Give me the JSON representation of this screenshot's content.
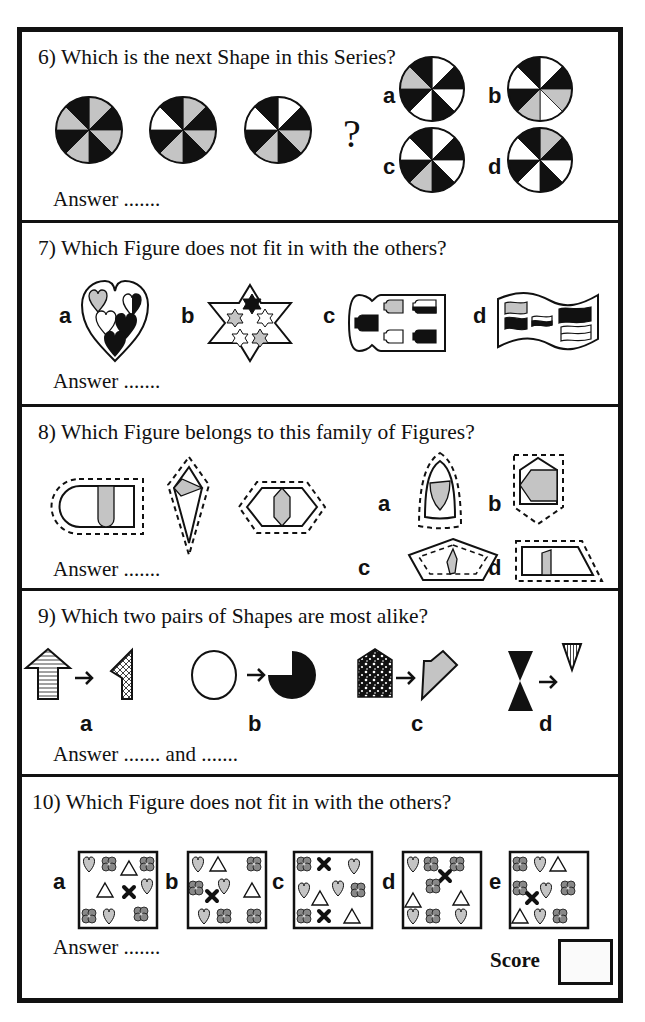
{
  "colors": {
    "ink": "#111111",
    "gray_fill": "#c4c4c4",
    "paper": "#ffffff"
  },
  "questions": [
    {
      "number": "6",
      "prompt": "6) Which is the next Shape in this Series?",
      "answer_line": "Answer .......",
      "question_mark": "?",
      "series": [
        [
          "gray",
          "black",
          "gray",
          "black",
          "gray",
          "black",
          "gray",
          "black"
        ],
        [
          "gray",
          "black",
          "gray",
          "black",
          "gray",
          "black",
          "white",
          "black"
        ],
        [
          "white",
          "black",
          "gray",
          "black",
          "gray",
          "black",
          "white",
          "black"
        ]
      ],
      "options": [
        {
          "label": "a",
          "segments": [
            "white",
            "black",
            "white",
            "black",
            "white",
            "black",
            "gray",
            "black"
          ]
        },
        {
          "label": "b",
          "segments": [
            "white",
            "black",
            "gray",
            "white",
            "gray",
            "black",
            "white",
            "black"
          ]
        },
        {
          "label": "c",
          "segments": [
            "white",
            "black",
            "white",
            "black",
            "gray",
            "black",
            "white",
            "black"
          ]
        },
        {
          "label": "d",
          "segments": [
            "gray",
            "black",
            "white",
            "black",
            "white",
            "black",
            "white",
            "black"
          ]
        }
      ]
    },
    {
      "number": "7",
      "prompt": "7) Which Figure does not fit in with the others?",
      "answer_line": "Answer .......",
      "options": [
        {
          "label": "a",
          "figure": "heart-of-hearts"
        },
        {
          "label": "b",
          "figure": "star-of-stars"
        },
        {
          "label": "c",
          "figure": "keyhole-of-keyholes"
        },
        {
          "label": "d",
          "figure": "flag-of-flags"
        }
      ]
    },
    {
      "number": "8",
      "prompt": "8) Which Figure belongs to this family of Figures?",
      "answer_line": "Answer .......",
      "family": [
        "dashed-rounded-rect",
        "dashed-kite",
        "dashed-hexagon"
      ],
      "options": [
        {
          "label": "a",
          "figure": "arch-shield"
        },
        {
          "label": "b",
          "figure": "pentagon-house"
        },
        {
          "label": "c",
          "figure": "pentagon-inner-dashed"
        },
        {
          "label": "d",
          "figure": "trapezoid"
        }
      ]
    },
    {
      "number": "9",
      "prompt": "9) Which two pairs of Shapes are most alike?",
      "answer_line": "Answer ....... and .......",
      "options": [
        {
          "label": "a",
          "from": "striped-arrow-shape",
          "to": "crosshatched-half"
        },
        {
          "label": "b",
          "from": "white-circle",
          "to": "black-three-quarter-circle"
        },
        {
          "label": "c",
          "from": "speckled-house",
          "to": "gray-half-house"
        },
        {
          "label": "d",
          "from": "black-hourglass",
          "to": "striped-triangle"
        }
      ]
    },
    {
      "number": "10",
      "prompt": "10) Which Figure does not fit in with the others?",
      "answer_line": "Answer .......",
      "options": [
        {
          "label": "a"
        },
        {
          "label": "b"
        },
        {
          "label": "c"
        },
        {
          "label": "d"
        },
        {
          "label": "e"
        }
      ]
    }
  ],
  "score": {
    "label": "Score",
    "value": ""
  }
}
